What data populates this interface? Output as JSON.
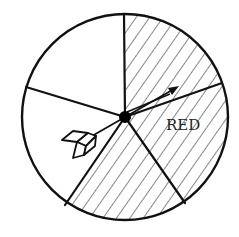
{
  "diagram": {
    "type": "spinner",
    "label_text": "RED",
    "colors": {
      "stroke": "#111111",
      "background": "#ffffff",
      "hatch": "#222222"
    },
    "sector_count": 5,
    "sectors": [
      {
        "id": "top-right",
        "hatched": true,
        "label": ""
      },
      {
        "id": "right",
        "hatched": true,
        "label": "RED"
      },
      {
        "id": "bottom",
        "hatched": true,
        "label": ""
      },
      {
        "id": "left",
        "hatched": false,
        "label": ""
      },
      {
        "id": "top-left",
        "hatched": false,
        "label": ""
      }
    ],
    "pointer": {
      "icon": "arrow-icon",
      "direction": "upper-right"
    }
  }
}
